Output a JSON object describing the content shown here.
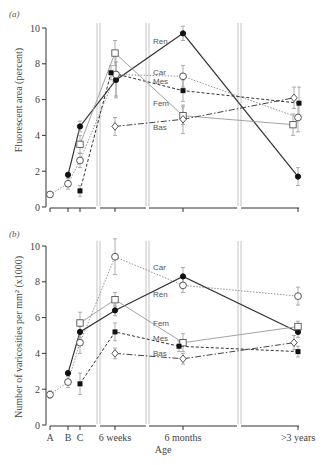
{
  "figure": {
    "panel_a_label": "(a)",
    "panel_b_label": "(b)",
    "xlabel": "Age"
  },
  "chart_data": [
    {
      "type": "line",
      "panel": "(a)",
      "title": "",
      "xlabel": "",
      "ylabel": "Fluorescent area (percent)",
      "ylim": [
        0,
        10
      ],
      "yticks": [
        0,
        2,
        4,
        6,
        8,
        10
      ],
      "categories": [
        "A",
        "B",
        "C",
        "6 weeks",
        "6 months",
        ">3 years"
      ],
      "show_xtick_labels": false,
      "grid": false,
      "legend": "inline labels right of 6-weeks break",
      "series": [
        {
          "name": "Ren",
          "marker": "filled-circle",
          "line": "solid",
          "color": "#333333",
          "values": [
            null,
            1.8,
            4.5,
            7.1,
            9.7,
            1.7
          ],
          "errors": [
            null,
            0.1,
            0.3,
            1.0,
            0.4,
            0.5
          ],
          "dx": [
            0,
            0,
            0,
            1,
            0,
            0
          ],
          "label_y": 9.3
        },
        {
          "name": "Car",
          "marker": "open-circle",
          "line": "dotted",
          "color": "#888888",
          "values": [
            0.7,
            1.3,
            2.6,
            7.4,
            7.3,
            5.0
          ],
          "errors": [
            0.1,
            0.3,
            0.4,
            1.2,
            0.6,
            0.8
          ],
          "dx": [
            0,
            0,
            0,
            1,
            0,
            0
          ],
          "label_y": 7.55
        },
        {
          "name": "Mes",
          "marker": "filled-square",
          "line": "dashed",
          "color": "#333333",
          "values": [
            null,
            null,
            0.9,
            7.5,
            6.5,
            5.8
          ],
          "errors": [
            null,
            null,
            0.3,
            0.4,
            0.6,
            0.9
          ],
          "dx": [
            0,
            0,
            0,
            -4,
            0,
            1
          ],
          "label_y": 7.05
        },
        {
          "name": "Fem",
          "marker": "open-square",
          "line": "solid-light",
          "color": "#999999",
          "values": [
            null,
            null,
            3.5,
            8.6,
            5.1,
            4.6
          ],
          "errors": [
            null,
            null,
            0.5,
            0.7,
            0.5,
            0.6
          ],
          "dx": [
            0,
            0,
            0,
            0,
            0,
            -5
          ],
          "label_y": 5.8
        },
        {
          "name": "Bas",
          "marker": "open-diamond",
          "line": "dash-dot",
          "color": "#444444",
          "values": [
            null,
            null,
            null,
            4.5,
            4.9,
            6.1
          ],
          "errors": [
            null,
            null,
            null,
            0.5,
            0.8,
            0.6
          ],
          "dx": [
            0,
            0,
            0,
            0,
            0,
            -4
          ],
          "label_y": 4.45
        }
      ]
    },
    {
      "type": "line",
      "panel": "(b)",
      "title": "",
      "xlabel": "Age",
      "ylabel": "Number of varicosities per mm² (x1000)",
      "ylim": [
        0,
        10
      ],
      "yticks": [
        0,
        2,
        4,
        6,
        8,
        10
      ],
      "categories": [
        "A",
        "B",
        "C",
        "6 weeks",
        "6 months",
        ">3 years"
      ],
      "show_xtick_labels": true,
      "grid": false,
      "legend": "inline labels right of 6-weeks break",
      "series": [
        {
          "name": "Car",
          "marker": "open-circle",
          "line": "dotted",
          "color": "#888888",
          "values": [
            1.7,
            2.4,
            4.6,
            9.4,
            7.8,
            7.2
          ],
          "errors": [
            0.2,
            0.3,
            0.6,
            1.0,
            0.4,
            0.5
          ],
          "dx": [
            0,
            0,
            0,
            0,
            0,
            0
          ],
          "label_y": 8.8
        },
        {
          "name": "Ren",
          "marker": "filled-circle",
          "line": "solid",
          "color": "#333333",
          "values": [
            null,
            2.9,
            5.2,
            6.4,
            8.3,
            5.2
          ],
          "errors": [
            null,
            0.1,
            0.3,
            0.3,
            0.5,
            0.3
          ],
          "dx": [
            0,
            0,
            0,
            0,
            0,
            0
          ],
          "label_y": 7.3
        },
        {
          "name": "Fem",
          "marker": "open-square",
          "line": "solid-light",
          "color": "#999999",
          "values": [
            null,
            null,
            5.7,
            7.0,
            4.6,
            5.5
          ],
          "errors": [
            null,
            null,
            0.6,
            0.4,
            0.5,
            0.3
          ],
          "dx": [
            0,
            0,
            0,
            0,
            0,
            0
          ],
          "label_y": 5.7
        },
        {
          "name": "Mes",
          "marker": "filled-square",
          "line": "dashed",
          "color": "#333333",
          "values": [
            null,
            null,
            2.3,
            5.2,
            4.4,
            4.1
          ],
          "errors": [
            null,
            null,
            0.6,
            0.5,
            0.3,
            0.3
          ],
          "dx": [
            0,
            0,
            0,
            0,
            -4,
            0
          ],
          "label_y": 4.85
        },
        {
          "name": "Bas",
          "marker": "open-diamond",
          "line": "dash-dot",
          "color": "#444444",
          "values": [
            null,
            null,
            null,
            4.0,
            3.7,
            4.6
          ],
          "errors": [
            null,
            null,
            null,
            0.3,
            0.3,
            0.4
          ],
          "dx": [
            0,
            0,
            0,
            0,
            0,
            -4
          ],
          "label_y": 4.0
        }
      ]
    }
  ]
}
